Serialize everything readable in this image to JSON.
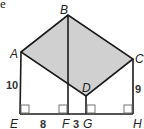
{
  "fragment_text": "e",
  "points": {
    "A": {
      "label": "A",
      "x": 21,
      "y": 52
    },
    "B": {
      "label": "B",
      "x": 68,
      "y": 15
    },
    "C": {
      "label": "C",
      "x": 133,
      "y": 59
    },
    "D": {
      "label": "D",
      "x": 86,
      "y": 96
    },
    "E": {
      "label": "E",
      "x": 20,
      "y": 114
    },
    "F": {
      "label": "F",
      "x": 68,
      "y": 114
    },
    "G": {
      "label": "G",
      "x": 86,
      "y": 114
    },
    "H": {
      "label": "H",
      "x": 133,
      "y": 114
    }
  },
  "measures": {
    "AE": "10",
    "EF": "8",
    "FG": "3",
    "CH": "9"
  },
  "colors": {
    "shade": "#d0d0d0",
    "line": "#1a1a1a",
    "right_angle": "#666666"
  }
}
